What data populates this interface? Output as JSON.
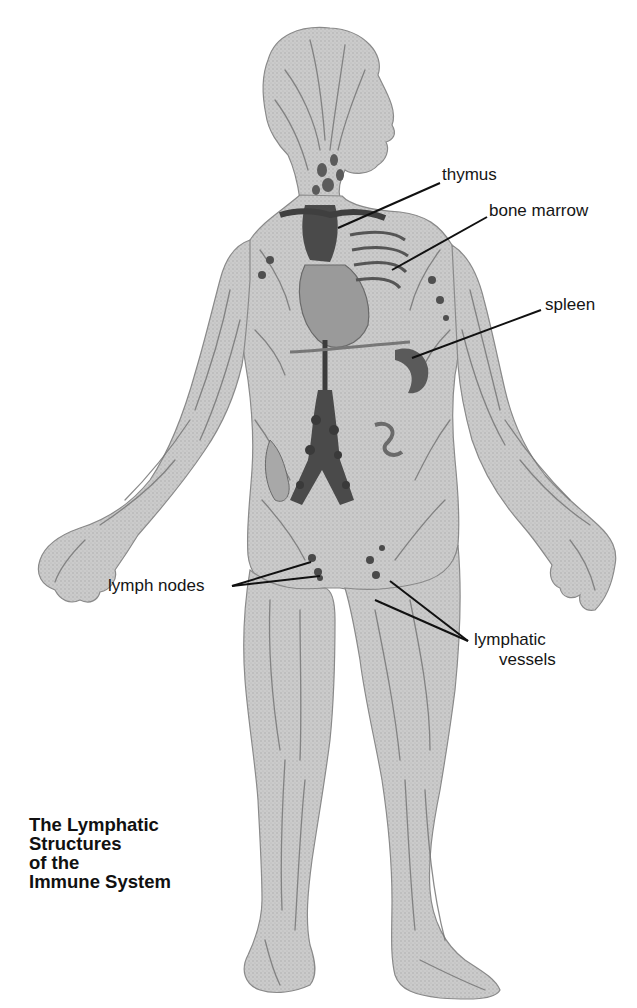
{
  "title": {
    "lines": [
      "The Lymphatic",
      "Structures",
      "of the",
      "Immune System"
    ]
  },
  "labels": {
    "thymus": "thymus",
    "bone_marrow": "bone marrow",
    "spleen": "spleen",
    "lymph_nodes": "lymph nodes",
    "lymphatic_vessels_line1": "lymphatic",
    "lymphatic_vessels_line2": "vessels"
  },
  "colors": {
    "background": "#ffffff",
    "skin": "#c9c9c9",
    "vessel": "#6e6e6e",
    "organ": "#5a5a5a",
    "leader_line": "#111111",
    "text": "#151515"
  }
}
